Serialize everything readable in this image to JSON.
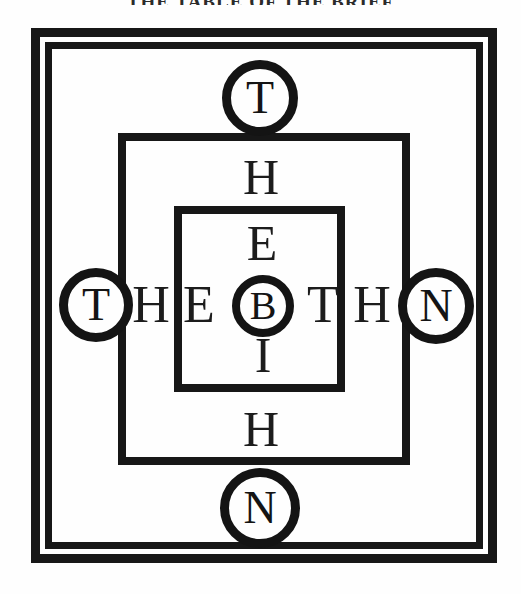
{
  "page": {
    "title_partial": "THE TABLE OF THE BRIEF",
    "background_color": "#ffffff",
    "ink_color": "#171717"
  },
  "diagram": {
    "name": "nested-square-talisman",
    "frames": [
      {
        "id": "outer-a",
        "label": "outer-frame-outline"
      },
      {
        "id": "outer-b",
        "label": "outer-frame-inline"
      },
      {
        "id": "middle",
        "label": "middle-frame"
      },
      {
        "id": "inner",
        "label": "inner-square"
      }
    ],
    "circles": {
      "top": {
        "letter": "T",
        "position": "top"
      },
      "bottom": {
        "letter": "N",
        "position": "bottom"
      },
      "left": {
        "letter": "T",
        "position": "left"
      },
      "right": {
        "letter": "N",
        "position": "right"
      },
      "center": {
        "letter": "B",
        "position": "center"
      }
    },
    "horizontal_row": {
      "sequence": "T H E B T H N",
      "letters": [
        "T",
        "H",
        "E",
        "B",
        "T",
        "H",
        "N"
      ],
      "free_letters": {
        "h_left": "H",
        "e_left": "E",
        "t_right": "T",
        "h_right": "H"
      }
    },
    "vertical_column": {
      "sequence": "T H E B I H N",
      "letters": [
        "T",
        "H",
        "E",
        "B",
        "I",
        "H",
        "N"
      ],
      "free_letters": {
        "h_top": "H",
        "e_top": "E",
        "i_bottom": "I",
        "h_bottom": "H"
      }
    }
  }
}
